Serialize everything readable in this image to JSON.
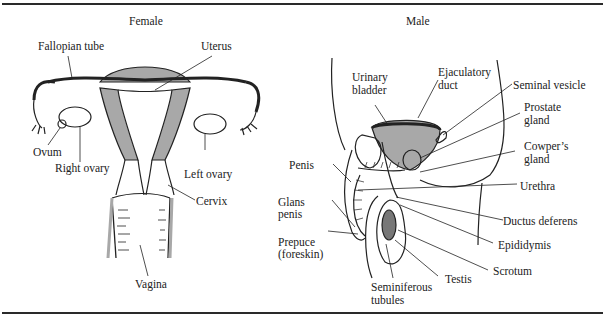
{
  "figure": {
    "panels": [
      {
        "title": "Female",
        "labels": {
          "fallopian_tube": "Fallopian tube",
          "uterus": "Uterus",
          "ovum": "Ovum",
          "right_ovary": "Right ovary",
          "left_ovary": "Left ovary",
          "cervix": "Cervix",
          "vagina": "Vagina"
        }
      },
      {
        "title": "Male",
        "labels": {
          "urinary_bladder_1": "Urinary",
          "urinary_bladder_2": "bladder",
          "ejaculatory_duct_1": "Ejaculatory",
          "ejaculatory_duct_2": "duct",
          "seminal_vesicle": "Seminal vesicle",
          "prostate_gland_1": "Prostate",
          "prostate_gland_2": "gland",
          "cowpers_gland_1": "Cowper’s",
          "cowpers_gland_2": "gland",
          "penis": "Penis",
          "urethra": "Urethra",
          "glans_penis_1": "Glans",
          "glans_penis_2": "penis",
          "ductus_deferens": "Ductus deferens",
          "epididymis": "Epididymis",
          "prepuce_1": "Prepuce",
          "prepuce_2": "(foreskin)",
          "scrotum": "Scrotum",
          "testis": "Testis",
          "seminiferous_tubules_1": "Seminiferous",
          "seminiferous_tubules_2": "tubules"
        }
      }
    ],
    "colors": {
      "line": "#222222",
      "tissue_fill": "#a8a8a8",
      "background": "#ffffff"
    }
  }
}
